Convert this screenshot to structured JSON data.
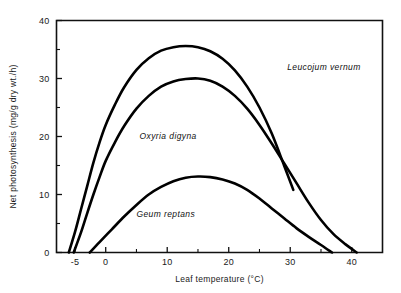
{
  "chart_data": {
    "type": "line",
    "title": "",
    "xlabel": "Leaf temperature (°C)",
    "ylabel": "Net photosynthesis (mg/g dry wt./h)",
    "xlim": [
      -8,
      45
    ],
    "ylim": [
      0,
      40
    ],
    "xticks": [
      -5,
      0,
      10,
      20,
      30,
      40
    ],
    "xticklabels": [
      "-5",
      "0",
      "10",
      "20",
      "30",
      "40"
    ],
    "xminorticks": [
      5,
      15,
      25,
      35
    ],
    "yticks": [
      0,
      10,
      20,
      30,
      40
    ],
    "yticklabels": [
      "0",
      "10",
      "20",
      "30",
      "40"
    ],
    "yminorticks": [
      5,
      15,
      25,
      35
    ],
    "grid": false,
    "legend_position": "inline-annotations",
    "series": [
      {
        "name": "Leucojum vernum",
        "label_x": 29.5,
        "label_y": 31.5,
        "points": [
          [
            -6.0,
            0.0
          ],
          [
            -5.0,
            3.5
          ],
          [
            -4.0,
            7.5
          ],
          [
            -3.0,
            11.5
          ],
          [
            -2.0,
            15.5
          ],
          [
            -1.0,
            19.0
          ],
          [
            0.0,
            22.0
          ],
          [
            1.5,
            25.5
          ],
          [
            3.0,
            28.5
          ],
          [
            5.0,
            31.5
          ],
          [
            7.0,
            33.5
          ],
          [
            9.0,
            34.8
          ],
          [
            11.0,
            35.4
          ],
          [
            13.0,
            35.6
          ],
          [
            15.0,
            35.4
          ],
          [
            17.0,
            34.7
          ],
          [
            19.0,
            33.4
          ],
          [
            21.0,
            31.4
          ],
          [
            23.0,
            28.6
          ],
          [
            25.0,
            25.0
          ],
          [
            27.0,
            20.5
          ],
          [
            29.0,
            15.0
          ],
          [
            30.5,
            10.8
          ]
        ]
      },
      {
        "name": "Oxyria digyna",
        "label_x": 5.5,
        "label_y": 19.5,
        "points": [
          [
            -5.2,
            0.0
          ],
          [
            -4.0,
            3.5
          ],
          [
            -3.0,
            6.8
          ],
          [
            -2.0,
            10.0
          ],
          [
            -1.0,
            13.0
          ],
          [
            0.0,
            15.8
          ],
          [
            1.5,
            19.0
          ],
          [
            3.0,
            21.8
          ],
          [
            5.0,
            24.8
          ],
          [
            7.0,
            27.0
          ],
          [
            9.0,
            28.6
          ],
          [
            11.0,
            29.5
          ],
          [
            13.0,
            29.9
          ],
          [
            15.0,
            30.0
          ],
          [
            17.0,
            29.6
          ],
          [
            19.0,
            28.6
          ],
          [
            21.0,
            27.0
          ],
          [
            23.0,
            24.8
          ],
          [
            25.0,
            22.0
          ],
          [
            27.0,
            18.8
          ],
          [
            29.0,
            15.4
          ],
          [
            31.0,
            12.0
          ],
          [
            33.0,
            8.6
          ],
          [
            35.0,
            5.6
          ],
          [
            37.0,
            3.2
          ],
          [
            39.0,
            1.4
          ],
          [
            40.8,
            0.0
          ]
        ]
      },
      {
        "name": "Geum reptans",
        "label_x": 5.0,
        "label_y": 6.2,
        "points": [
          [
            -2.6,
            0.0
          ],
          [
            -1.0,
            1.8
          ],
          [
            1.0,
            4.0
          ],
          [
            3.0,
            6.2
          ],
          [
            5.0,
            8.2
          ],
          [
            7.0,
            10.0
          ],
          [
            9.0,
            11.3
          ],
          [
            11.0,
            12.3
          ],
          [
            13.0,
            12.9
          ],
          [
            15.0,
            13.1
          ],
          [
            17.0,
            13.0
          ],
          [
            19.0,
            12.6
          ],
          [
            21.0,
            11.9
          ],
          [
            23.0,
            10.8
          ],
          [
            25.0,
            9.3
          ],
          [
            27.0,
            7.6
          ],
          [
            29.0,
            5.9
          ],
          [
            31.0,
            4.2
          ],
          [
            33.0,
            2.7
          ],
          [
            35.0,
            1.3
          ],
          [
            36.8,
            0.0
          ]
        ]
      }
    ]
  },
  "colors": {
    "ink": "#000000",
    "background": "#ffffff"
  }
}
